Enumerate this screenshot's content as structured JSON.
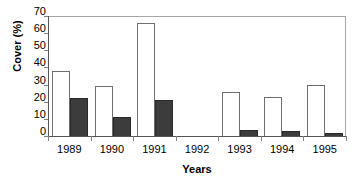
{
  "chart_data": {
    "type": "bar",
    "title": "",
    "xlabel": "Years",
    "ylabel": "Cover (%)",
    "categories": [
      "1989",
      "1990",
      "1991",
      "1992",
      "1993",
      "1994",
      "1995"
    ],
    "series": [
      {
        "name": "open-bar",
        "fill": "#ffffff",
        "values": [
          38,
          29,
          66,
          0,
          25.5,
          23,
          30
        ]
      },
      {
        "name": "filled-bar",
        "fill": "#3c3c3c",
        "values": [
          22,
          11,
          21,
          0,
          3.5,
          3,
          2
        ]
      }
    ],
    "ylim": [
      0,
      70
    ],
    "yticks": [
      0,
      10,
      20,
      30,
      40,
      50,
      60,
      70
    ],
    "ytick_labels": [
      "0",
      "10",
      "20",
      "30",
      "40",
      "50",
      "60",
      "70"
    ],
    "grid": false,
    "legend": "none",
    "axis_color": "#808080",
    "text_color": "#000000"
  }
}
